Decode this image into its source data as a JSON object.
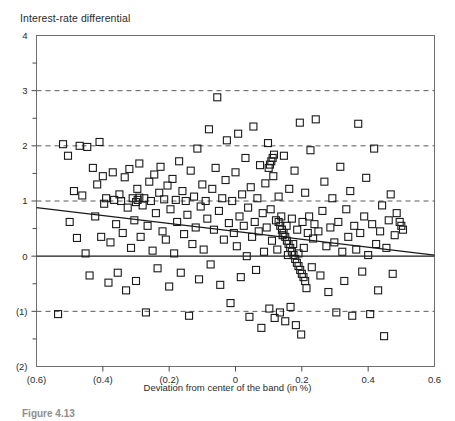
{
  "chart_data": {
    "type": "scatter",
    "title": "Interest-rate differential",
    "xlabel": "Deviation from center of the band (in %)",
    "ylabel": "Interest-rate differential",
    "caption": "Figure 4.13",
    "xlim": [
      -0.6,
      0.6
    ],
    "ylim": [
      -2,
      4
    ],
    "xticks": [
      -0.6,
      -0.4,
      -0.2,
      0,
      0.2,
      0.4,
      0.6
    ],
    "xticklabels": [
      "(0.6)",
      "(0.4)",
      "(0.2)",
      "0",
      "0.2",
      "0.4",
      "0.6"
    ],
    "yticks": [
      -2,
      -1,
      0,
      1,
      2,
      3,
      4
    ],
    "yticklabels": [
      "(2)",
      "(1)",
      "0",
      "1",
      "2",
      "3",
      "4"
    ],
    "y_minor_ticks": [
      -1.5,
      -0.5,
      0.5,
      1.5,
      2.5,
      3.5
    ],
    "gridlines_y": [
      3,
      2,
      1,
      -1
    ],
    "grid": "horizontal-dashed",
    "legend": "none",
    "marker": "open-square",
    "marker_size_px": 7,
    "marker_color": "#1a1a1a",
    "zero_line": {
      "y": 0,
      "style": "solid",
      "color": "#1a1a1a"
    },
    "trend_line": {
      "label": "fitted regression line",
      "style": "solid",
      "color": "#1a1a1a",
      "x_start": -0.6,
      "y_start": 0.88,
      "x_end": 0.6,
      "y_end": 0.02
    },
    "points": [
      [
        -0.535,
        -1.05
      ],
      [
        -0.52,
        2.03
      ],
      [
        -0.505,
        1.82
      ],
      [
        -0.5,
        0.62
      ],
      [
        -0.487,
        1.18
      ],
      [
        -0.478,
        0.33
      ],
      [
        -0.47,
        2.0
      ],
      [
        -0.462,
        1.1
      ],
      [
        -0.452,
        0.05
      ],
      [
        -0.447,
        1.98
      ],
      [
        -0.44,
        -0.35
      ],
      [
        -0.43,
        1.6
      ],
      [
        -0.423,
        0.72
      ],
      [
        -0.417,
        1.3
      ],
      [
        -0.41,
        2.07
      ],
      [
        -0.405,
        0.35
      ],
      [
        -0.4,
        1.45
      ],
      [
        -0.396,
        0.95
      ],
      [
        -0.39,
        1.05
      ],
      [
        -0.383,
        -0.48
      ],
      [
        -0.377,
        0.25
      ],
      [
        -0.37,
        1.52
      ],
      [
        -0.366,
        1.02
      ],
      [
        -0.36,
        0.58
      ],
      [
        -0.355,
        -0.3
      ],
      [
        -0.35,
        1.12
      ],
      [
        -0.345,
        1.0
      ],
      [
        -0.34,
        0.42
      ],
      [
        -0.334,
        1.43
      ],
      [
        -0.33,
        -0.62
      ],
      [
        -0.325,
        0.88
      ],
      [
        -0.32,
        1.58
      ],
      [
        -0.315,
        0.15
      ],
      [
        -0.31,
        1.05
      ],
      [
        -0.305,
        0.65
      ],
      [
        -0.3,
        -0.45
      ],
      [
        -0.296,
        1.22
      ],
      [
        -0.29,
        1.68
      ],
      [
        -0.286,
        0.35
      ],
      [
        -0.28,
        0.92
      ],
      [
        -0.275,
        1.05
      ],
      [
        -0.27,
        -1.02
      ],
      [
        -0.265,
        0.55
      ],
      [
        -0.26,
        1.35
      ],
      [
        -0.255,
        1.0
      ],
      [
        -0.25,
        0.1
      ],
      [
        -0.245,
        1.48
      ],
      [
        -0.24,
        0.78
      ],
      [
        -0.235,
        -0.22
      ],
      [
        -0.23,
        1.15
      ],
      [
        -0.226,
        1.62
      ],
      [
        -0.22,
        0.45
      ],
      [
        -0.215,
        1.03
      ],
      [
        -0.21,
        0.3
      ],
      [
        -0.205,
        1.28
      ],
      [
        -0.2,
        -0.55
      ],
      [
        -0.196,
        0.85
      ],
      [
        -0.19,
        1.4
      ],
      [
        -0.185,
        0.05
      ],
      [
        -0.18,
        1.02
      ],
      [
        -0.176,
        0.62
      ],
      [
        -0.17,
        1.72
      ],
      [
        -0.165,
        -0.3
      ],
      [
        -0.16,
        1.18
      ],
      [
        -0.155,
        0.4
      ],
      [
        -0.15,
        1.0
      ],
      [
        -0.145,
        0.75
      ],
      [
        -0.14,
        -1.08
      ],
      [
        -0.135,
        1.55
      ],
      [
        -0.13,
        0.22
      ],
      [
        -0.125,
        1.08
      ],
      [
        -0.12,
        0.52
      ],
      [
        -0.115,
        1.95
      ],
      [
        -0.11,
        -0.42
      ],
      [
        -0.105,
        0.9
      ],
      [
        -0.1,
        1.3
      ],
      [
        -0.096,
        0.12
      ],
      [
        -0.09,
        1.0
      ],
      [
        -0.085,
        0.68
      ],
      [
        -0.08,
        2.3
      ],
      [
        -0.075,
        -0.15
      ],
      [
        -0.07,
        1.22
      ],
      [
        -0.065,
        0.48
      ],
      [
        -0.06,
        1.6
      ],
      [
        -0.055,
        2.88
      ],
      [
        -0.05,
        0.82
      ],
      [
        -0.046,
        -0.52
      ],
      [
        -0.04,
        1.05
      ],
      [
        -0.035,
        0.3
      ],
      [
        -0.03,
        1.38
      ],
      [
        -0.026,
        2.1
      ],
      [
        -0.02,
        0.6
      ],
      [
        -0.015,
        -0.85
      ],
      [
        -0.01,
        1.0
      ],
      [
        -0.005,
        0.42
      ],
      [
        0.0,
        1.52
      ],
      [
        0.004,
        0.18
      ],
      [
        0.008,
        2.22
      ],
      [
        0.012,
        0.72
      ],
      [
        0.016,
        -0.38
      ],
      [
        0.02,
        1.12
      ],
      [
        0.025,
        0.55
      ],
      [
        0.03,
        1.78
      ],
      [
        0.034,
        0.0
      ],
      [
        0.038,
        0.88
      ],
      [
        0.042,
        -1.1
      ],
      [
        0.046,
        1.25
      ],
      [
        0.05,
        0.35
      ],
      [
        0.054,
        2.35
      ],
      [
        0.058,
        0.62
      ],
      [
        0.062,
        -0.25
      ],
      [
        0.066,
        1.05
      ],
      [
        0.07,
        0.45
      ],
      [
        0.074,
        1.65
      ],
      [
        0.078,
        -1.3
      ],
      [
        0.082,
        0.78
      ],
      [
        0.086,
        0.08
      ],
      [
        0.09,
        1.32
      ],
      [
        0.094,
        0.52
      ],
      [
        0.098,
        2.05
      ],
      [
        0.102,
        -0.95
      ],
      [
        0.106,
        0.85
      ],
      [
        0.11,
        0.28
      ],
      [
        0.114,
        1.45
      ],
      [
        0.118,
        -1.12
      ],
      [
        0.122,
        0.65
      ],
      [
        0.126,
        0.12
      ],
      [
        0.13,
        1.08
      ],
      [
        0.134,
        -1.02
      ],
      [
        0.138,
        0.72
      ],
      [
        0.142,
        0.38
      ],
      [
        0.146,
        1.82
      ],
      [
        0.15,
        -1.18
      ],
      [
        0.154,
        0.55
      ],
      [
        0.158,
        0.02
      ],
      [
        0.162,
        1.22
      ],
      [
        0.166,
        -0.92
      ],
      [
        0.17,
        0.68
      ],
      [
        0.174,
        0.22
      ],
      [
        0.178,
        1.55
      ],
      [
        0.182,
        -1.25
      ],
      [
        0.186,
        0.48
      ],
      [
        0.19,
        0.05
      ],
      [
        0.194,
        2.42
      ],
      [
        0.198,
        -1.42
      ],
      [
        0.202,
        0.62
      ],
      [
        0.206,
        0.15
      ],
      [
        0.21,
        1.15
      ],
      [
        0.214,
        -0.58
      ],
      [
        0.218,
        0.42
      ],
      [
        0.222,
        0.72
      ],
      [
        0.226,
        1.92
      ],
      [
        0.23,
        -0.2
      ],
      [
        0.234,
        0.32
      ],
      [
        0.238,
        0.58
      ],
      [
        0.242,
        2.48
      ],
      [
        0.25,
        0.45
      ],
      [
        0.256,
        -0.35
      ],
      [
        0.262,
        0.82
      ],
      [
        0.268,
        1.35
      ],
      [
        0.274,
        0.18
      ],
      [
        0.28,
        -0.65
      ],
      [
        0.286,
        0.52
      ],
      [
        0.292,
        1.05
      ],
      [
        0.298,
        0.25
      ],
      [
        0.304,
        -1.02
      ],
      [
        0.31,
        0.62
      ],
      [
        0.316,
        1.62
      ],
      [
        0.322,
        0.08
      ],
      [
        0.328,
        -0.45
      ],
      [
        0.334,
        0.85
      ],
      [
        0.34,
        0.35
      ],
      [
        0.346,
        1.18
      ],
      [
        0.352,
        -1.08
      ],
      [
        0.358,
        0.55
      ],
      [
        0.364,
        0.12
      ],
      [
        0.37,
        2.4
      ],
      [
        0.376,
        0.42
      ],
      [
        0.382,
        -0.28
      ],
      [
        0.388,
        0.72
      ],
      [
        0.394,
        1.42
      ],
      [
        0.4,
        0.02
      ],
      [
        0.406,
        -1.05
      ],
      [
        0.412,
        0.58
      ],
      [
        0.418,
        1.95
      ],
      [
        0.424,
        0.22
      ],
      [
        0.43,
        -0.62
      ],
      [
        0.436,
        0.45
      ],
      [
        0.442,
        0.92
      ],
      [
        0.448,
        -1.45
      ],
      [
        0.455,
        0.15
      ],
      [
        0.462,
        0.65
      ],
      [
        0.468,
        1.12
      ],
      [
        0.474,
        -0.32
      ],
      [
        0.48,
        0.38
      ],
      [
        0.486,
        0.78
      ],
      [
        0.13,
        0.62
      ],
      [
        0.135,
        0.55
      ],
      [
        0.14,
        0.48
      ],
      [
        0.145,
        0.42
      ],
      [
        0.15,
        0.35
      ],
      [
        0.155,
        0.28
      ],
      [
        0.16,
        0.22
      ],
      [
        0.165,
        0.15
      ],
      [
        0.17,
        0.08
      ],
      [
        0.175,
        0.02
      ],
      [
        0.18,
        -0.05
      ],
      [
        0.185,
        -0.12
      ],
      [
        0.19,
        -0.18
      ],
      [
        0.195,
        -0.25
      ],
      [
        0.2,
        -0.32
      ],
      [
        0.205,
        -0.38
      ],
      [
        0.21,
        -0.45
      ],
      [
        0.108,
        1.72
      ],
      [
        0.112,
        1.78
      ],
      [
        0.116,
        1.84
      ],
      [
        0.104,
        1.66
      ],
      [
        0.1,
        1.6
      ],
      [
        -0.295,
        1.02
      ],
      [
        -0.3,
        0.98
      ],
      [
        -0.29,
        1.06
      ],
      [
        0.5,
        0.55
      ],
      [
        0.505,
        0.48
      ],
      [
        0.495,
        0.62
      ]
    ]
  }
}
